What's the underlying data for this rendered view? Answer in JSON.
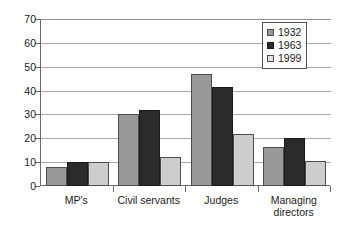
{
  "chart_data": {
    "type": "bar",
    "title": "",
    "subtitle": "",
    "xlabel": "",
    "ylabel": "",
    "ylim": [
      0,
      70
    ],
    "ytick_step": 10,
    "yticks": [
      "0",
      "10",
      "20",
      "30",
      "40",
      "50",
      "60",
      "70"
    ],
    "grid": true,
    "grid_axis": "y",
    "legend_position": "top-right-inside",
    "categories": [
      "MP's",
      "Civil servants",
      "Judges",
      "Managing\ndirectors"
    ],
    "series": [
      {
        "name": "1932",
        "color": "#999999",
        "values": [
          8,
          30,
          47,
          16.5
        ]
      },
      {
        "name": "1963",
        "color": "#2b2b2b",
        "values": [
          10,
          32,
          41.5,
          20
        ]
      },
      {
        "name": "1999",
        "color": "#cdcdcd",
        "values": [
          10,
          12,
          22,
          10.5
        ]
      }
    ]
  },
  "legend": {
    "items": [
      {
        "label": "1932"
      },
      {
        "label": "1963"
      },
      {
        "label": "1999"
      }
    ]
  },
  "axes": {
    "y_max_label": "70",
    "y_min_label": "0"
  }
}
